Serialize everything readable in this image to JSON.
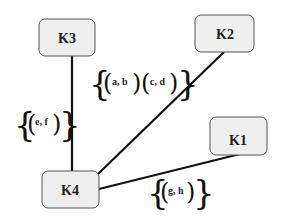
{
  "diagram": {
    "nodes": [
      {
        "id": "K3",
        "label": "K3"
      },
      {
        "id": "K2",
        "label": "K2"
      },
      {
        "id": "K1",
        "label": "K1"
      },
      {
        "id": "K4",
        "label": "K4"
      }
    ],
    "edges": [
      {
        "from": "K4",
        "to": "K3",
        "label_pairs": [
          "e, f"
        ]
      },
      {
        "from": "K4",
        "to": "K2",
        "label_pairs": [
          "a, b",
          "c, d"
        ]
      },
      {
        "from": "K4",
        "to": "K1",
        "label_pairs": [
          "g, h"
        ]
      }
    ],
    "labels": {
      "ab": "a, b",
      "cd": "c, d",
      "ef": "e, f",
      "gh": "g, h"
    },
    "colors": {
      "node_fill": "#efefef",
      "node_stroke": "#555555",
      "edge": "#111111"
    }
  }
}
